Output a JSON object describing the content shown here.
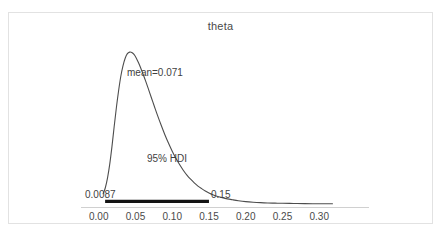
{
  "chart_data": {
    "type": "area",
    "title": "theta",
    "xlabel": "",
    "ylabel": "",
    "xlim": [
      -0.0105,
      0.3405
    ],
    "ylim": [
      0,
      1.06
    ],
    "grid": false,
    "legend": null,
    "x_ticks": [
      "0.00",
      "0.05",
      "0.10",
      "0.15",
      "0.20",
      "0.25",
      "0.30"
    ],
    "x_tick_values": [
      0.0,
      0.05,
      0.1,
      0.15,
      0.2,
      0.25,
      0.3
    ],
    "y_ticks": [],
    "annotations": [
      {
        "name": "mean",
        "text": "mean=0.071",
        "x": 0.071
      },
      {
        "name": "hdi",
        "text": "95% HDI"
      },
      {
        "name": "hdi-low",
        "text": "0.0087",
        "x": 0.0087
      },
      {
        "name": "hdi-high",
        "text": "0.15",
        "x": 0.15
      }
    ],
    "hdi": {
      "label": "95% HDI",
      "prob": 0.95,
      "low": 0.0087,
      "high": 0.15
    },
    "mean": 0.071,
    "curve": {
      "x": [
        0.006,
        0.009,
        0.012,
        0.015,
        0.018,
        0.021,
        0.024,
        0.027,
        0.03,
        0.033,
        0.036,
        0.039,
        0.042,
        0.045,
        0.048,
        0.051,
        0.054,
        0.057,
        0.06,
        0.064,
        0.068,
        0.072,
        0.076,
        0.08,
        0.085,
        0.09,
        0.095,
        0.1,
        0.105,
        0.11,
        0.115,
        0.12,
        0.125,
        0.13,
        0.135,
        0.14,
        0.145,
        0.15,
        0.156,
        0.162,
        0.168,
        0.175,
        0.182,
        0.19,
        0.2,
        0.21,
        0.22,
        0.23,
        0.24,
        0.25,
        0.265,
        0.28,
        0.3,
        0.318
      ],
      "y": [
        0.07,
        0.11,
        0.175,
        0.265,
        0.38,
        0.51,
        0.635,
        0.745,
        0.84,
        0.91,
        0.96,
        0.99,
        1.0,
        0.998,
        0.985,
        0.962,
        0.932,
        0.898,
        0.86,
        0.808,
        0.752,
        0.696,
        0.64,
        0.585,
        0.52,
        0.458,
        0.402,
        0.35,
        0.303,
        0.262,
        0.225,
        0.193,
        0.166,
        0.142,
        0.121,
        0.104,
        0.089,
        0.076,
        0.063,
        0.053,
        0.045,
        0.037,
        0.031,
        0.025,
        0.019,
        0.015,
        0.012,
        0.01,
        0.009,
        0.008,
        0.007,
        0.006,
        0.005,
        0.005
      ]
    },
    "colors": {
      "curve": "#4d4d4d",
      "hdi_bar": "#141414",
      "axis": "#d0d0d0",
      "text": "#3f3f3f",
      "frame": "#e2e2e2",
      "background": "#ffffff"
    }
  }
}
